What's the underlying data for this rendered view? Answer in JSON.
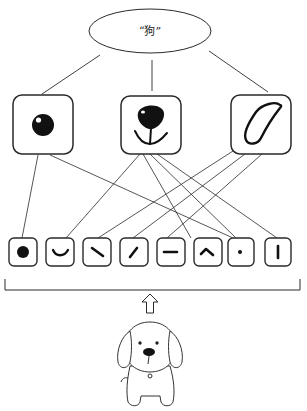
{
  "diagram": {
    "type": "hierarchical feature recognition",
    "concept": {
      "label": "“狗”",
      "shape": "ellipse",
      "cx": 150,
      "cy": 31,
      "rx": 61,
      "ry": 22
    },
    "concept_links": [
      {
        "from": [
          100,
          55
        ],
        "to": [
          42,
          94
        ]
      },
      {
        "from": [
          152,
          60
        ],
        "to": [
          152,
          91
        ]
      },
      {
        "from": [
          209,
          51
        ],
        "to": [
          268,
          92
        ]
      }
    ],
    "parts": [
      {
        "id": "eye",
        "icon": "eye-icon",
        "x": 13,
        "y": 95,
        "w": 60,
        "h": 59
      },
      {
        "id": "nose",
        "icon": "nose-icon",
        "x": 121,
        "y": 96,
        "w": 60,
        "h": 58
      },
      {
        "id": "ear",
        "icon": "ear-icon",
        "x": 231,
        "y": 95,
        "w": 60,
        "h": 59
      }
    ],
    "features": [
      {
        "id": "dot-large",
        "icon": "filled-dot-icon",
        "x": 9
      },
      {
        "id": "curve",
        "icon": "curve-smile-icon",
        "x": 46
      },
      {
        "id": "diag-down",
        "icon": "diagonal-backslash-icon",
        "x": 83
      },
      {
        "id": "diag-up",
        "icon": "diagonal-slash-icon",
        "x": 120
      },
      {
        "id": "horizontal",
        "icon": "horizontal-line-icon",
        "x": 157
      },
      {
        "id": "caret",
        "icon": "caret-angle-icon",
        "x": 194
      },
      {
        "id": "dot-small",
        "icon": "small-dot-icon",
        "x": 228
      },
      {
        "id": "vertical",
        "icon": "vertical-line-icon",
        "x": 265
      }
    ],
    "feature_box": {
      "y": 238,
      "w": 28,
      "h": 28
    },
    "part_links": [
      {
        "part": "eye",
        "feature": "dot-large",
        "from": [
          38,
          155
        ],
        "to": [
          22,
          238
        ]
      },
      {
        "part": "eye",
        "feature": "dot-small",
        "from": [
          50,
          155
        ],
        "to": [
          233,
          238
        ]
      },
      {
        "part": "nose",
        "feature": "curve",
        "from": [
          140,
          154
        ],
        "to": [
          66,
          238
        ]
      },
      {
        "part": "nose",
        "feature": "caret",
        "from": [
          143,
          154
        ],
        "to": [
          191,
          238
        ]
      },
      {
        "part": "nose",
        "feature": "dot-small",
        "from": [
          150,
          154
        ],
        "to": [
          236,
          238
        ]
      },
      {
        "part": "nose",
        "feature": "vertical",
        "from": [
          157,
          154
        ],
        "to": [
          277,
          238
        ]
      },
      {
        "part": "ear",
        "feature": "diag-down",
        "from": [
          233,
          151
        ],
        "to": [
          98,
          238
        ]
      },
      {
        "part": "ear",
        "feature": "diag-up",
        "from": [
          245,
          154
        ],
        "to": [
          133,
          238
        ]
      },
      {
        "part": "ear",
        "feature": "horizontal",
        "from": [
          262,
          154
        ],
        "to": [
          167,
          238
        ]
      }
    ],
    "bracket": {
      "x1": 5,
      "x2": 300,
      "top": 279,
      "bottom": 290
    },
    "arrow": {
      "direction": "up",
      "icon": "hollow-up-arrow-icon",
      "cx": 150,
      "top": 294,
      "bottom": 313
    },
    "input_image": {
      "icon": "cartoon-dog-icon",
      "description": "cartoon puppy (input stimulus)"
    },
    "colors": {
      "stroke": "#2a2a2a",
      "fill": "#111111",
      "background": "#ffffff"
    }
  }
}
